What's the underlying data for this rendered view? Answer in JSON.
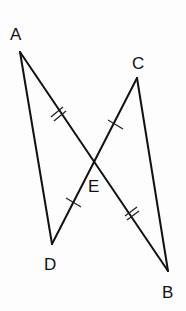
{
  "diagram": {
    "type": "geometry",
    "points": {
      "A": {
        "label": "A",
        "x": 20,
        "y": 52,
        "label_x": 10,
        "label_y": 40
      },
      "B": {
        "label": "B",
        "x": 168,
        "y": 271,
        "label_x": 162,
        "label_y": 297
      },
      "C": {
        "label": "C",
        "x": 137,
        "y": 78,
        "label_x": 133,
        "label_y": 68
      },
      "D": {
        "label": "D",
        "x": 52,
        "y": 244,
        "label_x": 44,
        "label_y": 270
      },
      "E": {
        "label": "E",
        "x": 96,
        "y": 162,
        "label_x": 88,
        "label_y": 190
      }
    },
    "segments": [
      {
        "from": "A",
        "to": "B"
      },
      {
        "from": "C",
        "to": "D"
      },
      {
        "from": "A",
        "to": "D"
      },
      {
        "from": "C",
        "to": "B"
      }
    ],
    "congruence_marks": [
      {
        "segment": "AE",
        "ticks": 2
      },
      {
        "segment": "EB",
        "ticks": 2
      },
      {
        "segment": "CE",
        "ticks": 1
      },
      {
        "segment": "ED",
        "ticks": 1
      }
    ],
    "colors": {
      "line": "#111111",
      "background": "#fdfdfd"
    }
  }
}
